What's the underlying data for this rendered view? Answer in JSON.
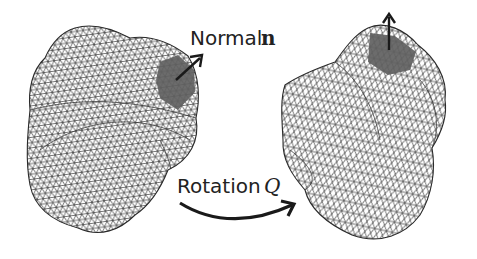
{
  "figure": {
    "normal_label": "Normal",
    "normal_symbol": "n",
    "rotation_label": "Rotation",
    "rotation_symbol": "Q",
    "colors": {
      "mesh_line": "#3a3a3a",
      "patch_fill": "#5f5f5f",
      "arrow": "#1a1a1a",
      "background": "#ffffff"
    },
    "objects": [
      {
        "name": "mesh-before-rotation",
        "description": "triangulated surface mesh with shaded patch and surface normal arrow"
      },
      {
        "name": "mesh-after-rotation",
        "description": "same mesh rotated by Q, shaded patch at top with normal pointing up"
      }
    ]
  }
}
